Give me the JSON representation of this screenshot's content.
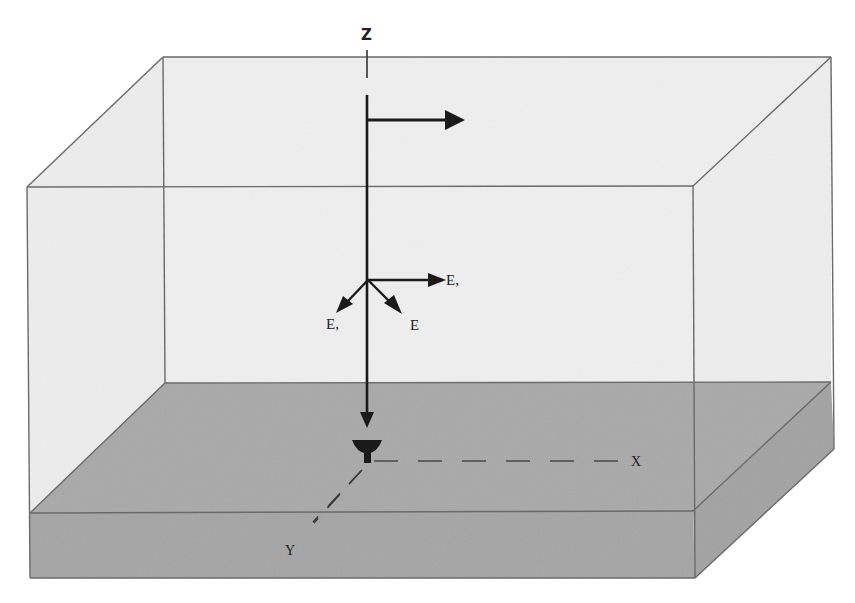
{
  "figure": {
    "colors": {
      "background": "#ffffff",
      "water_fill": "#efefef",
      "seabed_top": "#a9a9a9",
      "seabed_front": "#a4a4a4",
      "seabed_side": "#a2a2a2",
      "edge": "#6a6a6a",
      "ink": "#1a1a1a"
    },
    "axes": {
      "z_label": "Z",
      "x_label": "X",
      "y_label": "Y"
    },
    "vectors": {
      "e1_label": "E,",
      "e2_label": "E,",
      "e3_label": "E"
    },
    "elements": {
      "source_arrow": "horizontal-arrow-right",
      "receiver": "dish-receiver",
      "vertical_line": "downward-arrow"
    }
  }
}
